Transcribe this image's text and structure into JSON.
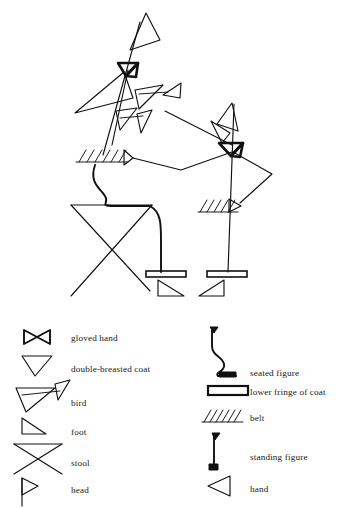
{
  "figure": {
    "title": "",
    "parts": [
      "gloved-hand-left",
      "gloved-hand-right",
      "double-breasted-coat",
      "bird",
      "foot-left",
      "foot-right",
      "stool",
      "head-left",
      "head-right",
      "belt-left",
      "belt-right",
      "lower-fringe-left",
      "lower-fringe-right",
      "seated-figure",
      "standing-figure",
      "hand-left",
      "hand-right"
    ]
  },
  "legend": {
    "left_column": [
      {
        "icon": "gloved-hand-icon",
        "label": "gloved hand"
      },
      {
        "icon": "double-breasted-coat-icon",
        "label": "double-breasted coat"
      },
      {
        "icon": "bird-icon",
        "label": "bird"
      },
      {
        "icon": "foot-icon",
        "label": "foot"
      },
      {
        "icon": "stool-icon",
        "label": "stool"
      },
      {
        "icon": "head-icon",
        "label": "head"
      }
    ],
    "right_column": [
      {
        "icon": "seated-figure-icon",
        "label": "seated figure"
      },
      {
        "icon": "lower-fringe-of-coat-icon",
        "label": "lower fringe of coat"
      },
      {
        "icon": "belt-icon",
        "label": "belt"
      },
      {
        "icon": "standing-figure-icon",
        "label": "standing figure"
      },
      {
        "icon": "hand-icon",
        "label": "hand"
      }
    ]
  },
  "colors": {
    "ink": "#111111",
    "background": "#ffffff",
    "text": "#181818"
  }
}
